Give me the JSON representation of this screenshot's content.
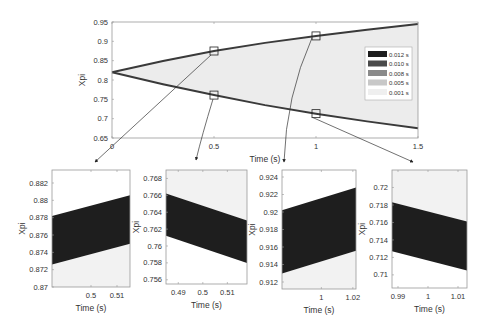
{
  "chart_data": [
    {
      "id": "main",
      "type": "area",
      "title": "",
      "xlabel": "Time (s)",
      "ylabel": "Xpi",
      "xlim": [
        0,
        1.5
      ],
      "ylim": [
        0.65,
        0.95
      ],
      "xticks": [
        0,
        0.5,
        1,
        1.5
      ],
      "xtick_labels": [
        "0",
        "0.5",
        "1",
        "1.5"
      ],
      "yticks": [
        0.65,
        0.7,
        0.75,
        0.8,
        0.85,
        0.9,
        0.95
      ],
      "ytick_labels": [
        "0.65",
        "0.7",
        "0.75",
        "0.8",
        "0.85",
        "0.9",
        "0.95"
      ],
      "grid": false,
      "legend_position": "inside-right",
      "legend": [
        {
          "label": "0.012 s",
          "color": "#1e1e1e"
        },
        {
          "label": "0.010 s",
          "color": "#4a4a4a"
        },
        {
          "label": "0.008 s",
          "color": "#8a8a8a"
        },
        {
          "label": "0.005 s",
          "color": "#c8c8c8"
        },
        {
          "label": "0.001 s",
          "color": "#efefef"
        }
      ],
      "upper_envelope": {
        "x": [
          0,
          0.25,
          0.5,
          0.75,
          1.0,
          1.25,
          1.5
        ],
        "y": [
          0.82,
          0.849,
          0.875,
          0.896,
          0.914,
          0.93,
          0.945
        ]
      },
      "lower_envelope": {
        "x": [
          0,
          0.25,
          0.5,
          0.75,
          1.0,
          1.25,
          1.5
        ],
        "y": [
          0.82,
          0.789,
          0.761,
          0.735,
          0.713,
          0.693,
          0.675
        ]
      },
      "zoom_markers": [
        {
          "x": 0.5,
          "y": 0.875,
          "target": "zoom1"
        },
        {
          "x": 0.5,
          "y": 0.761,
          "target": "zoom2"
        },
        {
          "x": 1.0,
          "y": 0.914,
          "target": "zoom3"
        },
        {
          "x": 1.0,
          "y": 0.713,
          "target": "zoom4"
        }
      ]
    },
    {
      "id": "zoom1",
      "type": "area",
      "xlabel": "Time (s)",
      "ylabel": "Xpi",
      "xlim": [
        0.485,
        0.515
      ],
      "ylim": [
        0.87,
        0.8835
      ],
      "xticks": [
        0.5,
        0.51
      ],
      "xtick_labels": [
        "0.5",
        "0.51"
      ],
      "yticks": [
        0.87,
        0.872,
        0.874,
        0.876,
        0.878,
        0.88,
        0.882
      ],
      "ytick_labels": [
        "0.87",
        "0.872",
        "0.874",
        "0.876",
        "0.878",
        "0.88",
        "0.882"
      ],
      "direction": "up",
      "series": [
        {
          "name": "0.012 s",
          "y_start": 0.8782,
          "y_end": 0.8806
        },
        {
          "name": "0.010 s",
          "y_start": 0.8752,
          "y_end": 0.8776
        },
        {
          "name": "0.008 s",
          "y_start": 0.874,
          "y_end": 0.8764
        },
        {
          "name": "0.005 s",
          "y_start": 0.8731,
          "y_end": 0.8755
        },
        {
          "name": "0.001 s",
          "y_start": 0.8727,
          "y_end": 0.8751
        }
      ]
    },
    {
      "id": "zoom2",
      "type": "area",
      "xlabel": "Time (s)",
      "ylabel": "Xpi",
      "xlim": [
        0.485,
        0.518
      ],
      "ylim": [
        0.7555,
        0.769
      ],
      "xticks": [
        0.49,
        0.5,
        0.51
      ],
      "xtick_labels": [
        "0.49",
        "0.5",
        "0.51"
      ],
      "yticks": [
        0.756,
        0.758,
        0.76,
        0.762,
        0.764,
        0.766,
        0.768
      ],
      "ytick_labels": [
        "0.756",
        "0.758",
        "0.76",
        "0.762",
        "0.764",
        "0.766",
        "0.768"
      ],
      "display_ytick_labels": [
        "0.756",
        "0.758",
        "0.76",
        "0.762",
        "0.764",
        "0.766",
        "0.768"
      ],
      "direction": "down",
      "series": [
        {
          "name": "0.012 s",
          "y_start": 0.7612,
          "y_end": 0.758
        },
        {
          "name": "0.010 s",
          "y_start": 0.7635,
          "y_end": 0.7603
        },
        {
          "name": "0.008 s",
          "y_start": 0.7648,
          "y_end": 0.7616
        },
        {
          "name": "0.005 s",
          "y_start": 0.7658,
          "y_end": 0.7626
        },
        {
          "name": "0.001 s",
          "y_start": 0.7661,
          "y_end": 0.7629
        }
      ]
    },
    {
      "id": "zoom3",
      "type": "area",
      "xlabel": "Time (s)",
      "ylabel": "Xpi",
      "xlim": [
        0.975,
        1.022
      ],
      "ylim": [
        0.9112,
        0.9248
      ],
      "xticks": [
        1,
        1.02
      ],
      "xtick_labels": [
        "1",
        "1.02"
      ],
      "yticks": [
        0.912,
        0.914,
        0.916,
        0.918,
        0.92,
        0.922,
        0.924
      ],
      "ytick_labels": [
        "0.912",
        "0.914",
        "0.916",
        "0.918",
        "0.92",
        "0.922",
        "0.924"
      ],
      "direction": "up",
      "series": [
        {
          "name": "0.012 s",
          "y_start": 0.9202,
          "y_end": 0.9228
        },
        {
          "name": "0.010 s",
          "y_start": 0.9164,
          "y_end": 0.919
        },
        {
          "name": "0.008 s",
          "y_start": 0.9146,
          "y_end": 0.9172
        },
        {
          "name": "0.005 s",
          "y_start": 0.9135,
          "y_end": 0.9161
        },
        {
          "name": "0.001 s",
          "y_start": 0.9131,
          "y_end": 0.9157
        }
      ]
    },
    {
      "id": "zoom4",
      "type": "area",
      "xlabel": "Time (s)",
      "ylabel": "Xpi",
      "xlim": [
        0.988,
        1.013
      ],
      "ylim": [
        0.7085,
        0.722
      ],
      "xticks": [
        0.99,
        1,
        1.01
      ],
      "xtick_labels": [
        "0.99",
        "1",
        "1.01"
      ],
      "yticks": [
        0.71,
        0.712,
        0.714,
        0.716,
        0.718,
        0.72
      ],
      "ytick_labels": [
        "0.71",
        "0.712",
        "0.714",
        "0.716",
        "0.718",
        "0.72"
      ],
      "direction": "down",
      "series": [
        {
          "name": "0.012 s",
          "y_start": 0.7127,
          "y_end": 0.7105
        },
        {
          "name": "0.010 s",
          "y_start": 0.7155,
          "y_end": 0.7133
        },
        {
          "name": "0.008 s",
          "y_start": 0.7168,
          "y_end": 0.7146
        },
        {
          "name": "0.005 s",
          "y_start": 0.7178,
          "y_end": 0.7156
        },
        {
          "name": "0.001 s",
          "y_start": 0.7182,
          "y_end": 0.716
        }
      ]
    }
  ]
}
